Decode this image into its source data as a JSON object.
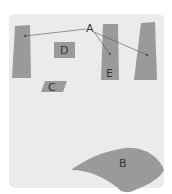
{
  "colors": {
    "background": "#ffffff",
    "panel": "#ebebeb",
    "shape": "#9a9a9a",
    "line": "#555555",
    "label": "#333333"
  },
  "labels": {
    "A": "A",
    "B": "B",
    "C": "C",
    "D": "D",
    "E": "E"
  }
}
